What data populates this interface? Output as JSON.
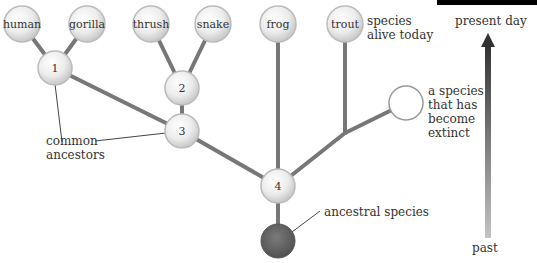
{
  "diagram": {
    "species_today": [
      {
        "id": "human",
        "label": "human"
      },
      {
        "id": "gorilla",
        "label": "gorilla"
      },
      {
        "id": "thrush",
        "label": "thrush"
      },
      {
        "id": "snake",
        "label": "snake"
      },
      {
        "id": "frog",
        "label": "frog"
      },
      {
        "id": "trout",
        "label": "trout"
      }
    ],
    "ancestors": [
      {
        "id": "a1",
        "label": "1"
      },
      {
        "id": "a2",
        "label": "2"
      },
      {
        "id": "a3",
        "label": "3"
      },
      {
        "id": "a4",
        "label": "4"
      }
    ],
    "annotations": {
      "species_alive_line1": "species",
      "species_alive_line2": "alive today",
      "extinct_line1": "a species",
      "extinct_line2": "that has",
      "extinct_line3": "become",
      "extinct_line4": "extinct",
      "common_line1": "common",
      "common_line2": "ancestors",
      "ancestral_species": "ancestral species"
    },
    "time_axis": {
      "top_label": "present day",
      "bottom_label": "past"
    },
    "colors": {
      "branch": "#777777",
      "node_fill": "#eeeeee",
      "ancestral_node": "#666666",
      "arrow_dark": "#333333",
      "arrow_light": "#bbbbbb",
      "text": "#333333"
    }
  }
}
